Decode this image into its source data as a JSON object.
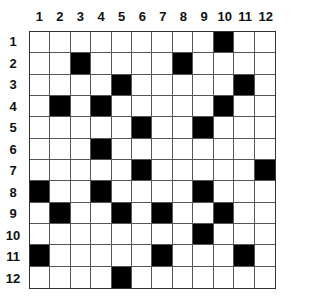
{
  "puzzle": {
    "type": "grid-puzzle",
    "rows": 12,
    "cols": 12,
    "column_labels": [
      "1",
      "2",
      "3",
      "4",
      "5",
      "6",
      "7",
      "8",
      "9",
      "10",
      "11",
      "12"
    ],
    "row_labels": [
      "1",
      "2",
      "3",
      "4",
      "5",
      "6",
      "7",
      "8",
      "9",
      "10",
      "11",
      "12"
    ],
    "colors": {
      "filled": "#000000",
      "empty": "#ffffff",
      "gridline": "#555555"
    },
    "black_cells": [
      [
        1,
        10
      ],
      [
        2,
        3
      ],
      [
        2,
        8
      ],
      [
        3,
        5
      ],
      [
        3,
        11
      ],
      [
        4,
        2
      ],
      [
        4,
        4
      ],
      [
        4,
        10
      ],
      [
        5,
        6
      ],
      [
        5,
        9
      ],
      [
        6,
        4
      ],
      [
        7,
        6
      ],
      [
        7,
        12
      ],
      [
        8,
        1
      ],
      [
        8,
        4
      ],
      [
        8,
        9
      ],
      [
        9,
        2
      ],
      [
        9,
        5
      ],
      [
        9,
        7
      ],
      [
        9,
        10
      ],
      [
        10,
        9
      ],
      [
        11,
        1
      ],
      [
        11,
        7
      ],
      [
        11,
        11
      ],
      [
        12,
        5
      ]
    ]
  }
}
